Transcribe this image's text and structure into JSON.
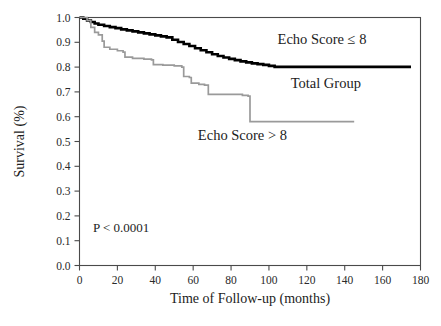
{
  "chart_data": {
    "type": "line",
    "title": "",
    "subtitle": "",
    "xlabel": "Time of Follow-up (months)",
    "ylabel": "Survival (%)",
    "xlim": [
      0,
      180
    ],
    "ylim": [
      0.0,
      1.0
    ],
    "xticks": [
      0,
      20,
      40,
      60,
      80,
      100,
      120,
      140,
      160,
      180
    ],
    "xtick_labels": [
      "0",
      "20",
      "40",
      "60",
      "80",
      "100",
      "120",
      "140",
      "160",
      "180"
    ],
    "yticks": [
      0.0,
      0.1,
      0.2,
      0.3,
      0.4,
      0.5,
      0.6,
      0.7,
      0.8,
      0.9,
      1.0
    ],
    "ytick_labels": [
      "0.0",
      "0.1",
      "0.2",
      "0.3",
      "0.4",
      "0.5",
      "0.6",
      "0.7",
      "0.8",
      "0.9",
      "1.0"
    ],
    "grid": false,
    "legend_position": "inline-annotations",
    "step_style": "post",
    "annotations": [
      {
        "name": "p-value",
        "text": "P < 0.0001",
        "x": 22,
        "y": 0.135
      }
    ],
    "series": [
      {
        "name": "Echo Score ≤ 8",
        "label": "Echo Score ≤ 8",
        "label_x": 128,
        "label_y": 0.895,
        "color": "#000000",
        "width": 2.6,
        "points": [
          [
            0,
            1.0
          ],
          [
            2,
            0.995
          ],
          [
            4,
            0.988
          ],
          [
            6,
            0.982
          ],
          [
            8,
            0.976
          ],
          [
            10,
            0.971
          ],
          [
            13,
            0.966
          ],
          [
            16,
            0.961
          ],
          [
            19,
            0.957
          ],
          [
            22,
            0.952
          ],
          [
            25,
            0.948
          ],
          [
            28,
            0.944
          ],
          [
            31,
            0.94
          ],
          [
            34,
            0.936
          ],
          [
            37,
            0.932
          ],
          [
            40,
            0.928
          ],
          [
            43,
            0.924
          ],
          [
            46,
            0.92
          ],
          [
            49,
            0.91
          ],
          [
            52,
            0.901
          ],
          [
            55,
            0.893
          ],
          [
            58,
            0.885
          ],
          [
            61,
            0.876
          ],
          [
            64,
            0.868
          ],
          [
            67,
            0.86
          ],
          [
            70,
            0.852
          ],
          [
            73,
            0.845
          ],
          [
            76,
            0.839
          ],
          [
            79,
            0.833
          ],
          [
            82,
            0.828
          ],
          [
            85,
            0.823
          ],
          [
            88,
            0.819
          ],
          [
            91,
            0.815
          ],
          [
            94,
            0.812
          ],
          [
            97,
            0.809
          ],
          [
            100,
            0.805
          ],
          [
            103,
            0.801
          ],
          [
            175,
            0.801
          ]
        ]
      },
      {
        "name": "Echo Score > 8",
        "label": "Echo Score > 8",
        "label_x": 86,
        "label_y": 0.508,
        "color": "#9a9a9a",
        "width": 1.7,
        "points": [
          [
            0,
            1.0
          ],
          [
            4,
            0.988
          ],
          [
            6,
            0.96
          ],
          [
            8,
            0.94
          ],
          [
            10,
            0.93
          ],
          [
            12,
            0.905
          ],
          [
            13,
            0.88
          ],
          [
            16,
            0.872
          ],
          [
            20,
            0.866
          ],
          [
            23,
            0.86
          ],
          [
            24,
            0.84
          ],
          [
            28,
            0.835
          ],
          [
            34,
            0.832
          ],
          [
            38,
            0.829
          ],
          [
            39,
            0.81
          ],
          [
            44,
            0.808
          ],
          [
            50,
            0.805
          ],
          [
            54,
            0.8
          ],
          [
            55,
            0.762
          ],
          [
            58,
            0.758
          ],
          [
            59,
            0.735
          ],
          [
            63,
            0.73
          ],
          [
            66,
            0.727
          ],
          [
            68,
            0.69
          ],
          [
            86,
            0.686
          ],
          [
            89,
            0.683
          ],
          [
            90,
            0.58
          ],
          [
            145,
            0.58
          ]
        ]
      }
    ],
    "total_group_label": {
      "name": "Total Group",
      "text": "Total Group",
      "x": 130,
      "y": 0.715
    }
  },
  "figure": {
    "background": "#ffffff",
    "frame_color": "#4a4a4a",
    "text_color": "#1c1c1c"
  }
}
